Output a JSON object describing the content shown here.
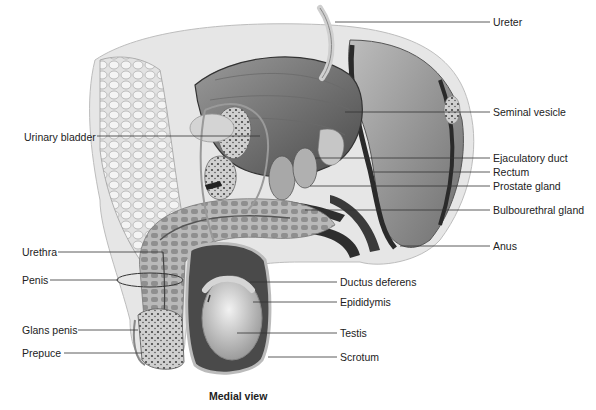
{
  "figure": {
    "caption": "Medial view",
    "left_labels": [
      {
        "id": "urinary-bladder",
        "text": "Urinary bladder",
        "x": 24,
        "y": 131,
        "line": [
          97,
          136,
          260,
          136
        ]
      },
      {
        "id": "urethra",
        "text": "Urethra",
        "x": 22,
        "y": 247,
        "line": [
          58,
          252,
          163,
          252
        ]
      },
      {
        "id": "penis",
        "text": "Penis",
        "x": 22,
        "y": 274,
        "line": [
          50,
          280,
          120,
          280
        ]
      },
      {
        "id": "glans-penis",
        "text": "Glans penis",
        "x": 22,
        "y": 324,
        "line": [
          78,
          330,
          136,
          330
        ]
      },
      {
        "id": "prepuce",
        "text": "Prepuce",
        "x": 22,
        "y": 347,
        "line": [
          64,
          353,
          142,
          353
        ]
      }
    ],
    "right_labels": [
      {
        "id": "ureter",
        "text": "Ureter",
        "x": 493,
        "y": 17,
        "line": [
          335,
          22,
          490,
          22
        ]
      },
      {
        "id": "seminal-vesicle",
        "text": "Seminal vesicle",
        "x": 493,
        "y": 107,
        "line": [
          345,
          112,
          490,
          112
        ]
      },
      {
        "id": "ejaculatory-duct",
        "text": "Ejaculatory duct",
        "x": 493,
        "y": 152,
        "line": [
          315,
          158,
          490,
          158
        ]
      },
      {
        "id": "rectum",
        "text": "Rectum",
        "x": 493,
        "y": 167,
        "line": [
          370,
          172,
          490,
          172
        ]
      },
      {
        "id": "prostate-gland",
        "text": "Prostate gland",
        "x": 493,
        "y": 181,
        "line": [
          310,
          186,
          490,
          186
        ]
      },
      {
        "id": "bulbourethral-gland",
        "text": "Bulbourethral gland",
        "x": 493,
        "y": 205,
        "line": [
          305,
          210,
          490,
          210
        ]
      },
      {
        "id": "anus",
        "text": "Anus",
        "x": 493,
        "y": 242,
        "line": [
          400,
          246,
          490,
          246
        ]
      },
      {
        "id": "ductus-deferens",
        "text": "Ductus deferens",
        "x": 340,
        "y": 276,
        "line": [
          250,
          282,
          337,
          282
        ]
      },
      {
        "id": "epididymis",
        "text": "Epididymis",
        "x": 340,
        "y": 297,
        "line": [
          253,
          302,
          337,
          302
        ]
      },
      {
        "id": "testis",
        "text": "Testis",
        "x": 340,
        "y": 327,
        "line": [
          237,
          333,
          337,
          333
        ]
      },
      {
        "id": "scrotum",
        "text": "Scrotum",
        "x": 340,
        "y": 351,
        "line": [
          268,
          357,
          337,
          357
        ]
      }
    ]
  },
  "colors": {
    "label_text": "#222222",
    "leader_line": "#333333",
    "tissue_dark": "#3a3a3a",
    "tissue_mid": "#8a8a8a",
    "tissue_light": "#d8d8d8",
    "background": "#ffffff"
  }
}
